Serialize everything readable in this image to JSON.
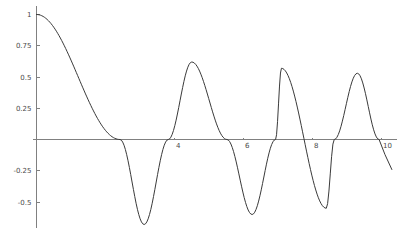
{
  "chart_data": {
    "type": "line",
    "title": "",
    "subtitle": "",
    "xlabel": "",
    "ylabel": "",
    "xlim": [
      0,
      10.4
    ],
    "ylim": [
      -0.72,
      1.04
    ],
    "grid": false,
    "legend": null,
    "legend_position": "none",
    "x_ticks": [
      {
        "value": 4,
        "label": "4"
      },
      {
        "value": 6,
        "label": "6"
      },
      {
        "value": 8,
        "label": "8"
      },
      {
        "value": 10,
        "label": "10"
      }
    ],
    "y_ticks": [
      {
        "value": 1,
        "label": "1"
      },
      {
        "value": 0.75,
        "label": "0.75"
      },
      {
        "value": 0.5,
        "label": "0.5"
      },
      {
        "value": 0.25,
        "label": "0.25"
      },
      {
        "value": -0.25,
        "label": "-0.25"
      },
      {
        "value": -0.5,
        "label": "-0.5"
      }
    ],
    "series": [
      {
        "name": "damped-oscillation",
        "color": "#3a3a3a",
        "expression": "damped cosine-like oscillation with decaying amplitude",
        "zero_crossings": [
          2.42,
          3.82,
          5.52,
          6.93,
          8.63,
          9.93
        ],
        "extrema": [
          {
            "x": 0.0,
            "y": 1.0,
            "kind": "max"
          },
          {
            "x": 3.12,
            "y": -0.68,
            "kind": "min"
          },
          {
            "x": 4.5,
            "y": 0.62,
            "kind": "max"
          },
          {
            "x": 6.25,
            "y": -0.6,
            "kind": "min"
          },
          {
            "x": 7.1,
            "y": 0.57,
            "kind": "max"
          },
          {
            "x": 8.4,
            "y": -0.55,
            "kind": "min"
          },
          {
            "x": 9.3,
            "y": 0.53,
            "kind": "max"
          }
        ],
        "points": [
          [
            0.0,
            1.0
          ],
          [
            0.1,
            0.9997
          ],
          [
            0.2,
            0.999
          ],
          [
            0.3,
            0.9977
          ],
          [
            0.4,
            0.996
          ],
          [
            0.5,
            0.9938
          ],
          [
            0.6,
            0.991
          ],
          [
            0.7,
            0.9872
          ],
          [
            0.8,
            0.982
          ],
          [
            0.9,
            0.9745
          ],
          [
            1.0,
            0.964
          ],
          [
            1.1,
            0.95
          ],
          [
            1.2,
            0.932
          ],
          [
            1.3,
            0.909
          ],
          [
            1.4,
            0.881
          ],
          [
            1.5,
            0.847
          ],
          [
            1.6,
            0.808
          ],
          [
            1.7,
            0.763
          ],
          [
            1.8,
            0.712
          ],
          [
            1.9,
            0.656
          ],
          [
            2.0,
            0.594
          ],
          [
            2.1,
            0.527
          ],
          [
            2.2,
            0.455
          ],
          [
            2.3,
            0.379
          ],
          [
            2.42,
            0.0
          ],
          [
            2.5,
            -0.063
          ],
          [
            2.6,
            -0.145
          ],
          [
            2.7,
            -0.24
          ],
          [
            2.8,
            -0.36
          ],
          [
            2.9,
            -0.48
          ],
          [
            3.0,
            -0.58
          ],
          [
            3.12,
            -0.68
          ],
          [
            3.25,
            -0.665
          ],
          [
            3.4,
            -0.61
          ],
          [
            3.55,
            -0.49
          ],
          [
            3.7,
            -0.29
          ],
          [
            3.82,
            0.0
          ],
          [
            3.95,
            0.21
          ],
          [
            4.1,
            0.42
          ],
          [
            4.25,
            0.54
          ],
          [
            4.5,
            0.62
          ],
          [
            4.75,
            0.6
          ],
          [
            4.95,
            0.52
          ],
          [
            5.15,
            0.37
          ],
          [
            5.35,
            0.19
          ],
          [
            5.52,
            0.0
          ],
          [
            5.7,
            -0.2
          ],
          [
            5.9,
            -0.4
          ],
          [
            6.05,
            -0.52
          ],
          [
            6.25,
            -0.6
          ],
          [
            6.45,
            -0.56
          ],
          [
            6.65,
            -0.42
          ],
          [
            6.8,
            -0.25
          ],
          [
            6.93,
            0.0
          ],
          [
            7.0,
            0.16
          ],
          [
            7.1,
            0.57
          ],
          [
            7.3,
            0.55
          ],
          [
            7.5,
            0.45
          ],
          [
            7.7,
            0.28
          ],
          [
            7.9,
            0.08
          ],
          [
            8.0,
            -0.08
          ],
          [
            8.2,
            -0.38
          ],
          [
            8.4,
            -0.55
          ],
          [
            8.55,
            -0.42
          ],
          [
            8.63,
            0.0
          ],
          [
            8.8,
            0.2
          ],
          [
            9.0,
            0.42
          ],
          [
            9.15,
            0.5
          ],
          [
            9.3,
            0.53
          ],
          [
            9.45,
            0.5
          ],
          [
            9.6,
            0.4
          ],
          [
            9.75,
            0.22
          ],
          [
            9.93,
            0.0
          ],
          [
            10.1,
            -0.12
          ],
          [
            10.3,
            -0.24
          ]
        ]
      }
    ]
  },
  "figure": {
    "background_color": "#ffffff",
    "axis_color": "#808080",
    "curve_color": "#3a3a3a",
    "label_color": "#4a4a4a"
  }
}
